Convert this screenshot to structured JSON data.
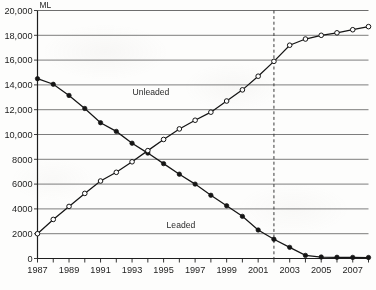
{
  "chart_data": {
    "type": "line",
    "title": "",
    "xlabel": "",
    "ylabel": "ML",
    "unit_label": "ML",
    "xlim": [
      1987,
      2008
    ],
    "ylim": [
      0,
      20000
    ],
    "grid": true,
    "legend_position": "inline-annotations",
    "x": [
      1987,
      1988,
      1989,
      1990,
      1991,
      1992,
      1993,
      1994,
      1995,
      1996,
      1997,
      1998,
      1999,
      2000,
      2001,
      2002,
      2003,
      2004,
      2005,
      2006,
      2007,
      2008
    ],
    "y_ticks": [
      0,
      2000,
      4000,
      6000,
      8000,
      10000,
      12000,
      14000,
      16000,
      18000,
      20000
    ],
    "y_tick_labels": [
      "0",
      "2000",
      "4000",
      "6000",
      "8000",
      "10,000",
      "12,000",
      "14,000",
      "16,000",
      "18,000",
      "20,000"
    ],
    "x_tick_labels": [
      "1987",
      "",
      "1989",
      "",
      "1991",
      "",
      "1993",
      "",
      "1995",
      "",
      "1997",
      "",
      "1999",
      "",
      "2001",
      "",
      "2003",
      "",
      "2005",
      "",
      "2007",
      ""
    ],
    "series": [
      {
        "name": "Leaded",
        "marker": "filled-circle",
        "color": "#151515",
        "label_x": 1996.1,
        "label_y": 2450,
        "values": [
          14500,
          14050,
          13150,
          12100,
          10950,
          10250,
          9300,
          8500,
          7650,
          6800,
          6000,
          5100,
          4250,
          3400,
          2300,
          1550,
          900,
          250,
          120,
          100,
          90,
          80
        ]
      },
      {
        "name": "Unleaded",
        "marker": "open-circle",
        "color": "#151515",
        "label_x": 1994.2,
        "label_y": 13150,
        "values": [
          2000,
          3150,
          4200,
          5250,
          6250,
          6950,
          7800,
          8700,
          9600,
          10450,
          11150,
          11800,
          12700,
          13600,
          14700,
          15900,
          17200,
          17700,
          18000,
          18200,
          18450,
          18700
        ]
      }
    ],
    "annotations": [
      {
        "type": "vertical-dashed-line",
        "x": 2002,
        "style": "dashed",
        "color": "#3a3a3a"
      }
    ]
  }
}
